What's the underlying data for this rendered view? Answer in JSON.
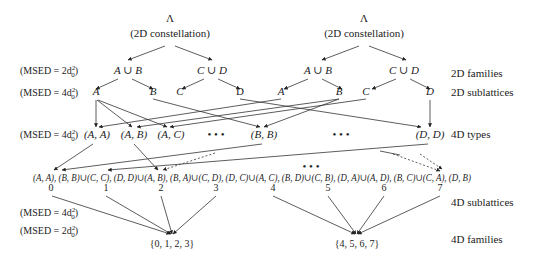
{
  "trees": [
    {
      "root_symbol": "Λ",
      "root_caption": "(2D constellation)",
      "families": [
        "A ∪ B",
        "C ∪ D"
      ],
      "sublattices": [
        "A",
        "B",
        "C",
        "D"
      ]
    },
    {
      "root_symbol": "Λ",
      "root_caption": "(2D constellation)",
      "families": [
        "A ∪ B",
        "C ∪ D"
      ],
      "sublattices": [
        "A",
        "B",
        "C",
        "D"
      ]
    }
  ],
  "msed_labels": {
    "families_2d": "(MSED = 2d",
    "sublattices_2d": "(MSED = 4d",
    "types_4d": "(MSED = 4d",
    "sublattices_4d": "(MSED = 4d",
    "families_4d": "(MSED = 2d",
    "sup": "2",
    "sub": "0",
    "close": ")"
  },
  "right_labels": {
    "families_2d": "2D families",
    "sublattices_2d": "2D sublattices",
    "types_4d": "4D types",
    "sublattices_4d": "4D sublattices",
    "families_4d": "4D families"
  },
  "types_4d": [
    "(A, A)",
    "(A, B)",
    "(A, C)",
    "(B, B)",
    "(D, D)"
  ],
  "ellipsis": "•   •   •",
  "sublattice_line": "(A, A), (B, B)∪(C, C), (D, D)∪(A, B), (B, A)∪(C, D), (D, C)∪(A, C), (B, D)∪(C, B), (D, A)∪(A, D), (B, C)∪(C, A), (D, B)",
  "sublattice_indices": [
    "0",
    "1",
    "2",
    "3",
    "4",
    "5",
    "6",
    "7"
  ],
  "families_4d": [
    "{0, 1, 2, 3}",
    "{4, 5, 6, 7}"
  ]
}
